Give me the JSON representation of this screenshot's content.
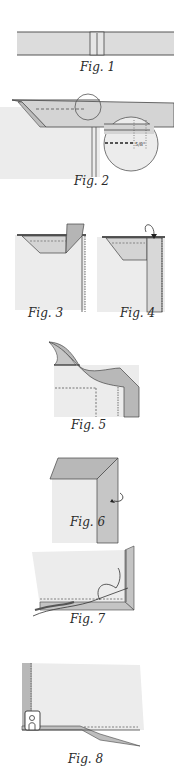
{
  "figures": [
    {
      "id": 1,
      "caption": "Fig. 1"
    },
    {
      "id": 2,
      "caption": "Fig. 2",
      "inset_label": "5/8\""
    },
    {
      "id": 3,
      "caption": "Fig. 3"
    },
    {
      "id": 4,
      "caption": "Fig. 4"
    },
    {
      "id": 5,
      "caption": "Fig. 5"
    },
    {
      "id": 6,
      "caption": "Fig. 6"
    },
    {
      "id": 7,
      "caption": "Fig. 7"
    },
    {
      "id": 8,
      "caption": "Fig. 8"
    }
  ],
  "colors": {
    "fabric_light": "#ececec",
    "fabric_mid": "#d8d8d8",
    "fabric_dark": "#b5b5b5",
    "outline": "#3a3a3a"
  }
}
